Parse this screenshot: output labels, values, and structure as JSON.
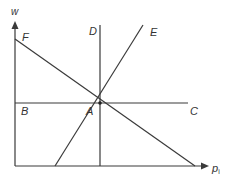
{
  "diagram": {
    "type": "economic-diagram",
    "axes": {
      "y_label": "w",
      "x_label": "p",
      "x_label_subscript": "i"
    },
    "points": {
      "A": "A",
      "B": "B",
      "C": "C",
      "D": "D",
      "E": "E",
      "F": "F"
    },
    "lines": [
      {
        "name": "BC",
        "kind": "horizontal",
        "from": "B",
        "to": "C"
      },
      {
        "name": "D",
        "kind": "vertical",
        "through": "A"
      },
      {
        "name": "E",
        "kind": "upward-sloping",
        "through": "A"
      },
      {
        "name": "F",
        "kind": "downward-sloping",
        "through": "A"
      }
    ],
    "colors": {
      "line": "#3a3a3a",
      "text": "#333333",
      "background": "#ffffff"
    }
  }
}
